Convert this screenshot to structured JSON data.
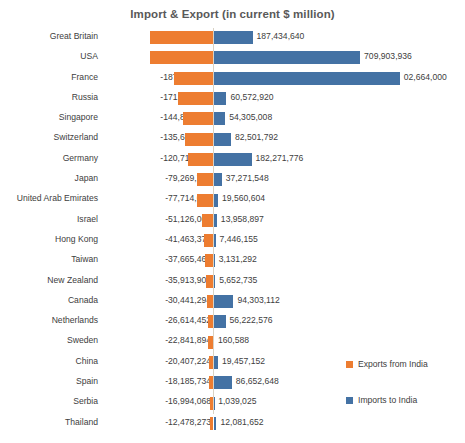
{
  "chart": {
    "title": "Import & Export (in current $ million)",
    "colors": {
      "exports": "#ED7D31",
      "imports": "#4472A4",
      "axis": "#D9D2C4",
      "text": "#404040"
    }
  },
  "legend": {
    "exports_label": "Exports from India",
    "imports_label": "Imports to India"
  },
  "chart_data": {
    "type": "bar",
    "orientation": "horizontal",
    "title": "Import & Export (in current $ million)",
    "xlabel": "",
    "ylabel": "",
    "grid": false,
    "legend_position": "right",
    "categories": [
      "Great Britain",
      "USA",
      "France",
      "Russia",
      "Singapore",
      "Switzerland",
      "Germany",
      "Japan",
      "United Arab Emirates",
      "Israel",
      "Hong Kong",
      "Taiwan",
      "New Zealand",
      "Canada",
      "Netherlands",
      "Sweden",
      "China",
      "Spain",
      "Serbia",
      "Thailand"
    ],
    "series": [
      {
        "name": "Exports from India",
        "color": "#ED7D31",
        "values": [
          -306143296,
          -304189024,
          -187133744,
          -171032960,
          -144829552,
          -135689408,
          -120712784,
          -79269728,
          -77714088,
          -51126008,
          -41463376,
          -37665464,
          -35913900,
          -30441294,
          -26614452,
          -22841894,
          -20407224,
          -18185734,
          -16994068,
          -12478273
        ],
        "labels": [
          "-306,143,296",
          "-304,189,024",
          "-187,133,744",
          "-171,032,960",
          "-144,829,552",
          "-135,689,408",
          "-120,712,784",
          "-79,269,728",
          "-77,714,088",
          "-51,126,008",
          "-41,463,376",
          "-37,665,464",
          "-35,913,900",
          "-30,441,294",
          "-26,614,452",
          "-22,841,894",
          "-20,407,224",
          "-18,185,734",
          "-16,994,068",
          "-12,478,273"
        ]
      },
      {
        "name": "Imports to India",
        "color": "#4472A4",
        "values": [
          187434640,
          709903936,
          902664000,
          60572920,
          54305008,
          82501792,
          182271776,
          37271548,
          19560604,
          13958897,
          7446155,
          3131292,
          5652735,
          94303112,
          56222576,
          160588,
          19457152,
          86652648,
          1039025,
          12081652
        ],
        "labels": [
          "187,434,640",
          "709,903,936",
          "02,664,000",
          "60,572,920",
          "54,305,008",
          "82,501,792",
          "182,271,776",
          "37,271,548",
          "19,560,604",
          "13,958,897",
          "7,446,155",
          "3,131,292",
          "5,652,735",
          "94,303,112",
          "56,222,576",
          "160,588",
          "19,457,152",
          "86,652,648",
          "1,039,025",
          "12,081,652"
        ]
      }
    ]
  }
}
